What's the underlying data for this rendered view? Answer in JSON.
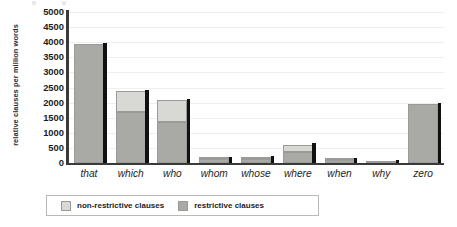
{
  "chart_data": {
    "type": "bar",
    "stacked": true,
    "title": "",
    "subtitle": "",
    "xlabel": "",
    "ylabel": "relative clauses per million words",
    "ylim": [
      0,
      5000
    ],
    "ytick_step": 500,
    "yticks": [
      "5000",
      "4500",
      "4000",
      "3500",
      "3000",
      "2500",
      "2000",
      "1500",
      "1000",
      "500",
      "0"
    ],
    "grid": true,
    "grid_axis": "y",
    "legend_position": "bottom",
    "categories": [
      "that",
      "which",
      "who",
      "whom",
      "whose",
      "where",
      "when",
      "why",
      "zero"
    ],
    "series": [
      {
        "name": "restrictive clauses",
        "color": "#a9a9a5",
        "values": [
          3940,
          1700,
          1370,
          120,
          140,
          370,
          90,
          20,
          1950
        ]
      },
      {
        "name": "non-restrictive clauses",
        "color": "#d8d8d4",
        "values": [
          0,
          670,
          710,
          30,
          40,
          230,
          20,
          0,
          0
        ]
      }
    ],
    "totals": [
      3940,
      2370,
      2080,
      150,
      180,
      600,
      110,
      20,
      1950
    ]
  },
  "legend": {
    "items": [
      {
        "label": "non-restrictive clauses",
        "swatch": "nonrestrictive"
      },
      {
        "label": "restrictive clauses",
        "swatch": "restrictive"
      }
    ]
  },
  "colors": {
    "nonrestrictive": "#d8d8d4",
    "restrictive": "#a9a9a5",
    "axis": "#3a3a3a",
    "grid": "#efefef",
    "shadow": "#111111",
    "text": "#1d1d1d"
  }
}
